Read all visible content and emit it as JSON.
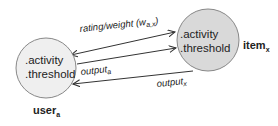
{
  "diagram": {
    "nodes": [
      {
        "id": "user",
        "label": "user",
        "subscript": "a",
        "attributes": [
          ".activity",
          ".threshold"
        ],
        "fill": "#efefef"
      },
      {
        "id": "item",
        "label": "item",
        "subscript": "x",
        "attributes": [
          ".activity",
          ".threshold"
        ],
        "fill": "#d9d9d9"
      }
    ],
    "edges": [
      {
        "label": "rating/weight (w",
        "label_sub": "a,x",
        "label_end": ")",
        "direction": "bidirectional"
      },
      {
        "label": "output",
        "label_sub": "a",
        "direction": "user-to-item"
      },
      {
        "label": "output",
        "label_sub": "x",
        "direction": "item-to-user"
      }
    ]
  }
}
